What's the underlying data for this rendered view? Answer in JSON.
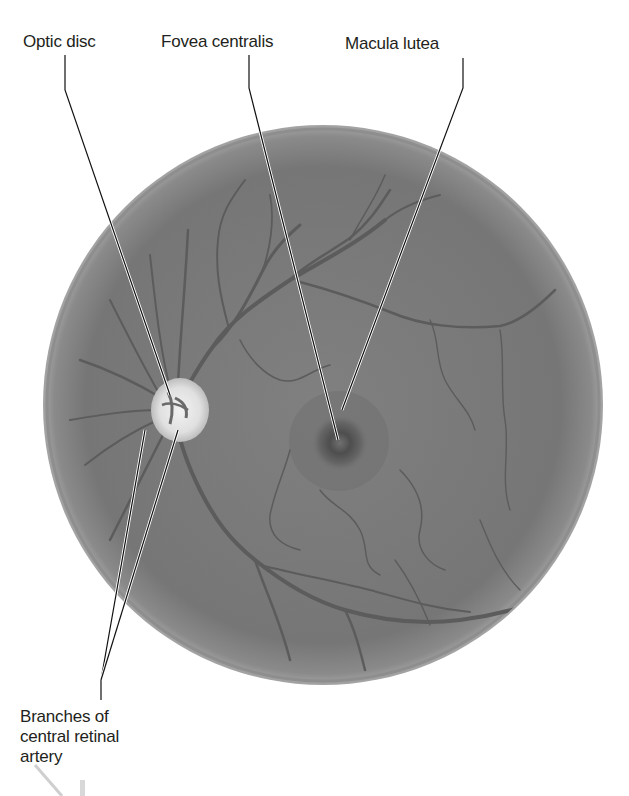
{
  "figure": {
    "colors": {
      "background": "#ffffff",
      "fundus": "#7a7a7a",
      "fundus_rim": "#9a9a9a",
      "vessel": "#5a5a5a",
      "optic_disc": "#e8e8e8",
      "fovea": "#4e4e4e",
      "leader_line": "#111111"
    }
  },
  "labels": {
    "optic_disc": "Optic disc",
    "fovea_centralis": "Fovea centralis",
    "macula_lutea": "Macula lutea",
    "branches_line1": "Branches of",
    "branches_line2": "central retinal",
    "branches_line3": "artery"
  }
}
